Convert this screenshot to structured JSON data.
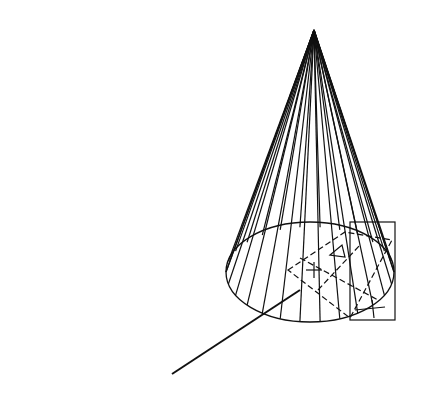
{
  "figure": {
    "background": "#ffffff",
    "stroke": "#111111",
    "cone": {
      "apex": [
        314,
        30
      ],
      "base_center": [
        310,
        272
      ],
      "base_rx": 84,
      "base_ry": 50,
      "generator_count": 14
    },
    "section_box": {
      "x": 350,
      "y": 222,
      "w": 45,
      "h": 98
    },
    "leader_line": {
      "x1": 172,
      "y1": 374,
      "x2": 300,
      "y2": 290
    }
  }
}
